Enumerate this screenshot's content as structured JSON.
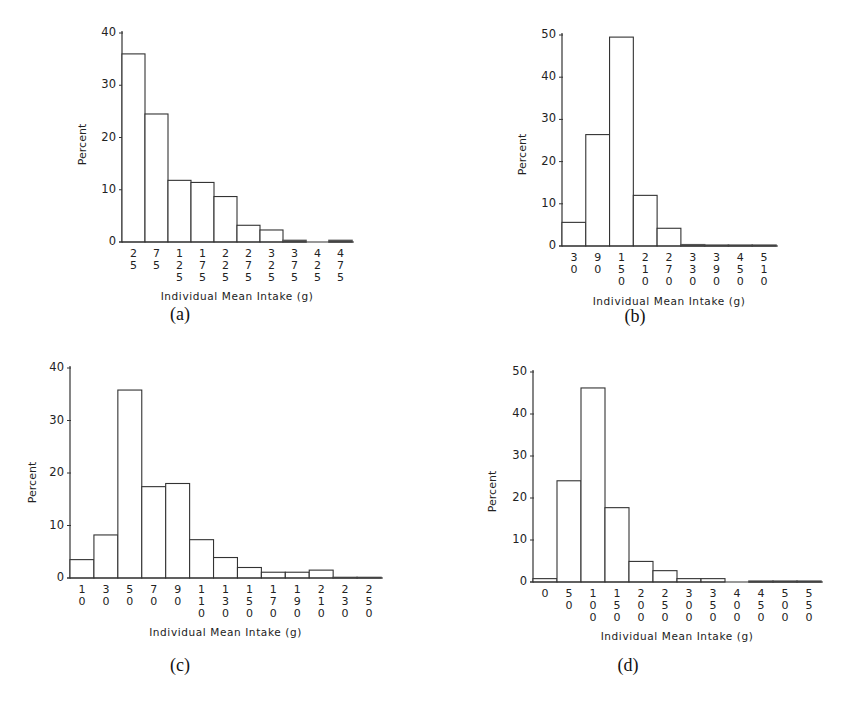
{
  "chart_data": [
    {
      "id": "a",
      "type": "bar",
      "caption": "(a)",
      "title": "",
      "xlabel": "Individual Mean Intake (g)",
      "ylabel": "Percent",
      "ylim": [
        0,
        40
      ],
      "yticks": [
        0,
        10,
        20,
        30,
        40
      ],
      "categories": [
        "25",
        "75",
        "125",
        "175",
        "225",
        "275",
        "325",
        "375",
        "425",
        "475"
      ],
      "values": [
        36.0,
        24.5,
        11.8,
        11.4,
        8.7,
        3.2,
        2.3,
        0.3,
        0.0,
        0.3
      ],
      "grid": false,
      "legend": null
    },
    {
      "id": "b",
      "type": "bar",
      "caption": "(b)",
      "title": "",
      "xlabel": "Individual Mean Intake (g)",
      "ylabel": "Percent",
      "ylim": [
        0,
        50
      ],
      "yticks": [
        0,
        10,
        20,
        30,
        40,
        50
      ],
      "categories": [
        "30",
        "90",
        "150",
        "210",
        "270",
        "330",
        "390",
        "450",
        "510"
      ],
      "values": [
        5.6,
        26.4,
        49.5,
        12.0,
        4.2,
        0.3,
        0.2,
        0.2,
        0.2
      ],
      "grid": false,
      "legend": null
    },
    {
      "id": "c",
      "type": "bar",
      "caption": "(c)",
      "title": "",
      "xlabel": "Individual Mean Intake (g)",
      "ylabel": "Percent",
      "ylim": [
        0,
        40
      ],
      "yticks": [
        0,
        10,
        20,
        30,
        40
      ],
      "categories": [
        "10",
        "30",
        "50",
        "70",
        "90",
        "110",
        "130",
        "150",
        "170",
        "190",
        "210",
        "230",
        "250"
      ],
      "values": [
        3.5,
        8.2,
        35.8,
        17.4,
        18.0,
        7.3,
        3.9,
        2.0,
        1.1,
        1.1,
        1.5,
        0.1,
        0.1
      ],
      "grid": false,
      "legend": null
    },
    {
      "id": "d",
      "type": "bar",
      "caption": "(d)",
      "title": "",
      "xlabel": "Individual Mean Intake (g)",
      "ylabel": "Percent",
      "ylim": [
        0,
        50
      ],
      "yticks": [
        0,
        10,
        20,
        30,
        40,
        50
      ],
      "categories": [
        "0",
        "50",
        "100",
        "150",
        "200",
        "250",
        "300",
        "350",
        "400",
        "450",
        "500",
        "550"
      ],
      "values": [
        0.8,
        24.1,
        46.2,
        17.7,
        4.9,
        2.7,
        0.8,
        0.8,
        0.0,
        0.2,
        0.2,
        0.2
      ],
      "grid": false,
      "legend": null
    }
  ],
  "layout": {
    "panels": [
      {
        "left": 122,
        "top": 33,
        "width": 230,
        "height": 209,
        "ylabel_x": 52,
        "caption_x": 150,
        "caption_y": 318
      },
      {
        "left": 562,
        "top": 35,
        "width": 214,
        "height": 211,
        "ylabel_x": 494,
        "caption_x": 605,
        "caption_y": 320
      },
      {
        "left": 70,
        "top": 368,
        "width": 311,
        "height": 210,
        "ylabel_x": 2,
        "caption_x": 150,
        "caption_y": 670
      },
      {
        "left": 533,
        "top": 372,
        "width": 288,
        "height": 210,
        "ylabel_x": 466,
        "caption_x": 598,
        "caption_y": 670
      }
    ]
  }
}
